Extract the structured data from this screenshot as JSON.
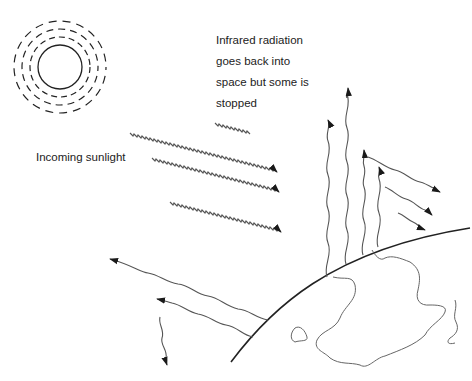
{
  "diagram": {
    "labels": {
      "infrared": [
        "Infrared radiation",
        "goes back into",
        "space but some is",
        "stopped"
      ],
      "sunlight": "Incoming sunlight"
    },
    "elements": {
      "sun": "sun-icon",
      "earth_surface": "earth-curve",
      "incoming_rays_count": 4,
      "outgoing_ir_up_count": 4,
      "reflected_back_down_count": 3,
      "scattered_left_count": 3
    },
    "colors": {
      "background": "#ffffff",
      "line": "#222222",
      "wave": "#555555"
    }
  }
}
